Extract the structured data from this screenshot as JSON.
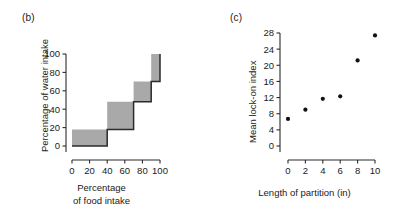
{
  "figure": {
    "background": "#ffffff",
    "ink_color": "#1a1a1a",
    "fill_color": "#a9a9a9"
  },
  "panels": [
    {
      "id": "b",
      "label": "(b)",
      "xlabel_line1": "Percentage",
      "xlabel_line2": "of food intake",
      "ylabel": "Percentage of water intake"
    },
    {
      "id": "c",
      "label": "(c)",
      "xlabel": "Length of partition (in)",
      "ylabel": "Mean lock-on index"
    }
  ],
  "chart_data": [
    {
      "type": "area",
      "panel": "b",
      "title": "(b)",
      "xlabel": "Percentage of food intake",
      "ylabel": "Percentage of water intake",
      "xlim": [
        0,
        100
      ],
      "ylim": [
        0,
        100
      ],
      "xticks": [
        0,
        20,
        40,
        60,
        80,
        100
      ],
      "yticks": [
        0,
        20,
        40,
        60,
        80,
        100
      ],
      "xticklabels": [
        "0",
        "20",
        "40",
        "60",
        "80",
        "100"
      ],
      "yticklabels": [
        "0",
        "20",
        "40",
        "60",
        "80",
        "100"
      ],
      "grid": false,
      "legend": "none",
      "style": "step-staircase-filled",
      "step_edges": [
        0,
        40,
        70,
        90,
        100
      ],
      "step_lower": [
        0,
        18,
        48,
        70
      ],
      "step_upper": [
        18,
        48,
        70,
        100
      ],
      "steps": [
        {
          "x_start": 0,
          "x_end": 40,
          "y_bottom": 0,
          "y_top": 18
        },
        {
          "x_start": 40,
          "x_end": 70,
          "y_bottom": 18,
          "y_top": 48
        },
        {
          "x_start": 70,
          "x_end": 90,
          "y_bottom": 48,
          "y_top": 70
        },
        {
          "x_start": 90,
          "x_end": 100,
          "y_bottom": 70,
          "y_top": 100
        }
      ]
    },
    {
      "type": "scatter",
      "panel": "c",
      "title": "(c)",
      "xlabel": "Length of partition (in)",
      "ylabel": "Mean lock-on index",
      "xlim": [
        0,
        10
      ],
      "ylim": [
        0,
        28
      ],
      "xticks": [
        0,
        2,
        4,
        6,
        8,
        10
      ],
      "yticks": [
        0,
        4,
        8,
        12,
        16,
        20,
        24,
        28
      ],
      "xticklabels": [
        "0",
        "2",
        "4",
        "6",
        "8",
        "10"
      ],
      "yticklabels": [
        "0",
        "4",
        "8",
        "12",
        "16",
        "20",
        "24",
        "28"
      ],
      "grid": false,
      "legend": "none",
      "marker": "filled-circle",
      "x": [
        0,
        2,
        4,
        6,
        8,
        10
      ],
      "y": [
        6.7,
        9.0,
        11.7,
        12.3,
        21.2,
        27.4
      ],
      "points": [
        {
          "x": 0,
          "y": 6.7
        },
        {
          "x": 2,
          "y": 9.0
        },
        {
          "x": 4,
          "y": 11.7
        },
        {
          "x": 6,
          "y": 12.3
        },
        {
          "x": 8,
          "y": 21.2
        },
        {
          "x": 10,
          "y": 27.4
        }
      ]
    }
  ]
}
